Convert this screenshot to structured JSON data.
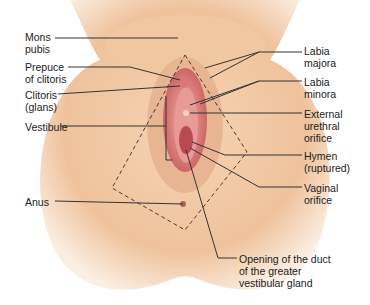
{
  "figure": {
    "type": "anatomical-illustration",
    "colors": {
      "skin": "#f2c9a4",
      "skin_shadow": "#e0a985",
      "mucosa": "#d9767a",
      "label_text": "#222222",
      "leader_line": "#333333"
    }
  },
  "labels": {
    "mons_pubis": "Mons\npubis",
    "prepuce": "Prepuce\nof clitoris",
    "clitoris": "Clitoris\n(glans)",
    "vestibule": "Vestibule",
    "anus": "Anus",
    "labia_majora": "Labia\nmajora",
    "labia_minora": "Labia\nminora",
    "urethral_orifice": "External\nurethral\norifice",
    "hymen": "Hymen\n(ruptured)",
    "vaginal_orifice": "Vaginal\norifice",
    "gland_duct": "Opening of the duct\nof the greater\nvestibular gland"
  }
}
